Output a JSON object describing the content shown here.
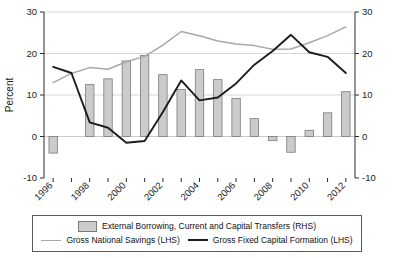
{
  "chart_data": {
    "type": "bar",
    "title": "",
    "xlabel": "",
    "ylabel": "Percent",
    "ylim": [
      -10,
      30
    ],
    "y2lim": [
      -10,
      30
    ],
    "yticks": [
      "30",
      "20",
      "10",
      "0",
      "-10"
    ],
    "ytick_values": [
      30,
      20,
      10,
      0,
      -10
    ],
    "y2ticks": [
      "30",
      "20",
      "10",
      "0",
      "-10"
    ],
    "grid": "horizontal",
    "legend_position": "below-plot",
    "categories": [
      1996,
      1997,
      1998,
      1999,
      2000,
      2001,
      2002,
      2003,
      2004,
      2005,
      2006,
      2007,
      2008,
      2009,
      2010,
      2011,
      2012
    ],
    "xtick_labels": [
      "1996",
      "1998",
      "2000",
      "2002",
      "2004",
      "2006",
      "2008",
      "2010",
      "2012"
    ],
    "xtick_label_years": [
      1996,
      1998,
      2000,
      2002,
      2004,
      2006,
      2008,
      2010,
      2012
    ],
    "xtick_rotation": 45,
    "series": [
      {
        "name": "External Borrowing, Current and Capital Transfers (RHS)",
        "type": "bar",
        "axis": "right",
        "color": "#cbcbcb",
        "edge_color": "#7a7a7a",
        "values": [
          -4.0,
          0.0,
          12.5,
          13.9,
          18.2,
          19.5,
          14.9,
          11.3,
          16.1,
          13.7,
          9.2,
          4.3,
          -1.0,
          -3.8,
          1.5,
          5.7,
          10.8
        ]
      },
      {
        "name": "Gross National Savings (LHS)",
        "type": "line",
        "axis": "left",
        "color": "#a8a8a8",
        "values": [
          13.0,
          15.2,
          16.6,
          16.2,
          18.0,
          19.3,
          22.0,
          25.3,
          24.3,
          23.0,
          22.3,
          21.9,
          21.0,
          21.1,
          22.6,
          24.3,
          26.4
        ]
      },
      {
        "name": "Gross Fixed Capital Formation (LHS)",
        "type": "line",
        "axis": "left",
        "color": "#1c1c1c",
        "values": [
          16.8,
          15.3,
          3.4,
          2.1,
          -1.5,
          -1.1,
          5.9,
          13.5,
          8.7,
          9.4,
          12.8,
          17.3,
          20.6,
          24.5,
          20.3,
          19.2,
          15.3
        ]
      }
    ],
    "legend": [
      {
        "label": "External Borrowing, Current and Capital Transfers (RHS)",
        "marker": "bar-swatch"
      },
      {
        "label": "Gross National Savings (LHS)",
        "marker": "gray-line"
      },
      {
        "label": "Gross Fixed Capital Formation (LHS)",
        "marker": "black-line"
      }
    ]
  }
}
